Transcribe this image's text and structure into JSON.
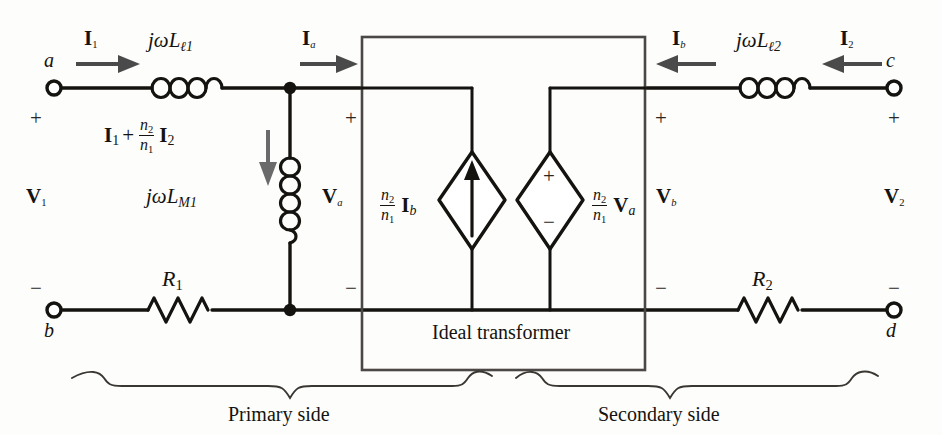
{
  "figure": {
    "ink_color": "#15130f",
    "arrow_color": "#4a4a4a",
    "box_color": "#4a4744"
  },
  "terminals": {
    "a": "a",
    "b": "b",
    "c": "c",
    "d": "d"
  },
  "polarity": {
    "plus": "+",
    "minus": "−"
  },
  "currents": {
    "i1": "I",
    "i1_sub": "1",
    "ia": "I",
    "ia_sub": "a",
    "ib": "I",
    "ib_sub": "b",
    "i2": "I",
    "i2_sub": "2",
    "branch_first": "I",
    "branch_first_sub": "1",
    "branch_plus": "+",
    "branch_second": "I",
    "branch_second_sub": "2"
  },
  "voltages": {
    "v1": "V",
    "v1_sub": "1",
    "va": "V",
    "va_sub": "a",
    "vb": "V",
    "vb_sub": "b",
    "v2": "V",
    "v2_sub": "2"
  },
  "components": {
    "leakage1": "jωL",
    "leakage1_sub": "ℓ1",
    "leakage2": "jωL",
    "leakage2_sub": "ℓ2",
    "magnetizing": "jωL",
    "magnetizing_sub": "M1",
    "r1": "R",
    "r1_sub": "1",
    "r2": "R",
    "r2_sub": "2"
  },
  "turns_ratio": {
    "numerator": "n",
    "numerator_sub": "2",
    "denominator": "n",
    "denominator_sub": "1"
  },
  "sources": {
    "current_source_label_phasor": "I",
    "current_source_label_sub": "b",
    "voltage_source_label_phasor": "V",
    "voltage_source_label_sub": "a",
    "voltage_source_plus": "+",
    "voltage_source_minus": "−"
  },
  "labels": {
    "ideal_transformer": "Ideal transformer",
    "primary_side": "Primary side",
    "secondary_side": "Secondary side"
  }
}
